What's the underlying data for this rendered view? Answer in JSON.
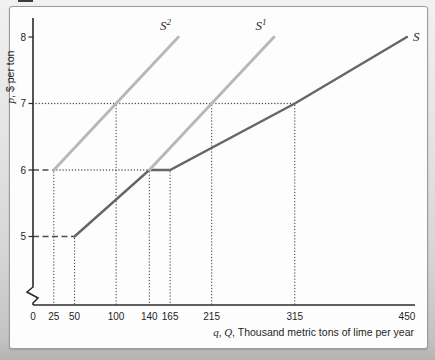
{
  "page": {
    "bg_top": "#f1f1f1",
    "bg_bottom": "#b4b4b4",
    "panel_bg": "#fdfdfd",
    "panel_border": "#9b9b9b"
  },
  "chart_data": {
    "type": "line",
    "title": "",
    "xlabel": "q, Q, Thousand metric tons of lime per year",
    "ylabel": "p, $ per ton",
    "xlabel_var": "q, Q",
    "xlabel_rest": ", Thousand metric tons of lime per year",
    "ylabel_var": "p",
    "ylabel_rest": ", $ per ton",
    "xlim": [
      0,
      450
    ],
    "ylim": [
      5,
      8
    ],
    "grid": false,
    "y_axis_break": true,
    "legend_position": "curve-end-labels",
    "x_ticks": [
      0,
      25,
      50,
      100,
      140,
      165,
      215,
      315,
      450
    ],
    "y_ticks": [
      5,
      6,
      7,
      8
    ],
    "series": [
      {
        "name": "S",
        "label_base": "S",
        "label_sup": "",
        "label_pos": "right",
        "color": "#63666a",
        "width": 2.4,
        "points": [
          [
            50,
            5
          ],
          [
            140,
            6
          ],
          [
            165,
            6
          ],
          [
            315,
            7
          ],
          [
            450,
            8
          ]
        ]
      },
      {
        "name": "S1",
        "label_base": "S",
        "label_sup": "1",
        "label_pos": "above",
        "color": "#b5b8b3",
        "width": 2.8,
        "points": [
          [
            140,
            6
          ],
          [
            290,
            8
          ]
        ]
      },
      {
        "name": "S2",
        "label_base": "S",
        "label_sup": "2",
        "label_pos": "above",
        "color": "#b5b8b3",
        "width": 2.8,
        "points": [
          [
            25,
            6
          ],
          [
            175,
            8
          ]
        ]
      }
    ],
    "guides": {
      "dashed_h": [
        {
          "p": 5,
          "from": 0,
          "to": 50
        },
        {
          "p": 6,
          "from": 0,
          "to": 25
        }
      ],
      "dotted_h": [
        {
          "p": 6,
          "from": 25,
          "to": 140
        },
        {
          "p": 7,
          "from": 0,
          "to": 315
        }
      ],
      "dotted_v": [
        {
          "q": 25,
          "p": 6
        },
        {
          "q": 50,
          "p": 5
        },
        {
          "q": 100,
          "p": 7
        },
        {
          "q": 140,
          "p": 6
        },
        {
          "q": 165,
          "p": 6
        },
        {
          "q": 215,
          "p": 7
        },
        {
          "q": 315,
          "p": 7
        }
      ]
    },
    "colors": {
      "axis": "#2b2b2b",
      "guide": "#4d4d4d",
      "text": "#1f1f1f",
      "supply": "#63666a",
      "supply_shifted": "#b5b8b3"
    }
  }
}
